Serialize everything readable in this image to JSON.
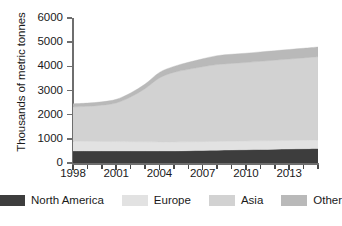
{
  "chart_data": {
    "type": "area",
    "stacked": true,
    "title": "",
    "xlabel": "",
    "ylabel": "Thousands of metric tonnes",
    "ylim": [
      0,
      6000
    ],
    "xlim": [
      1998,
      2015
    ],
    "ytick_labels": [
      "0",
      "1000",
      "2000",
      "3000",
      "4000",
      "5000",
      "6000"
    ],
    "ytick_values": [
      0,
      1000,
      2000,
      3000,
      4000,
      5000,
      6000
    ],
    "xtick_labels": [
      "1998",
      "2001",
      "2004",
      "2007",
      "2010",
      "2013"
    ],
    "xtick_values": [
      1998,
      2001,
      2004,
      2007,
      2010,
      2013
    ],
    "grid": false,
    "legend_position": "bottom",
    "x": [
      1998,
      1999,
      2000,
      2001,
      2002,
      2003,
      2004,
      2005,
      2006,
      2007,
      2008,
      2009,
      2010,
      2011,
      2012,
      2013,
      2014,
      2015
    ],
    "series": [
      {
        "name": "North America",
        "color": "#3d3d3d",
        "values": [
          500,
          500,
          500,
          500,
          500,
          500,
          500,
          500,
          510,
          520,
          530,
          540,
          550,
          560,
          570,
          580,
          590,
          600
        ]
      },
      {
        "name": "Europe",
        "color": "#e2e2e2",
        "values": [
          400,
          395,
          390,
          385,
          380,
          375,
          370,
          368,
          366,
          364,
          362,
          360,
          358,
          356,
          354,
          352,
          350,
          350
        ]
      },
      {
        "name": "Asia",
        "color": "#d2d2d2",
        "values": [
          1420,
          1450,
          1500,
          1600,
          1850,
          2200,
          2650,
          2880,
          3000,
          3100,
          3180,
          3220,
          3250,
          3290,
          3330,
          3370,
          3410,
          3450
        ]
      },
      {
        "name": "Other",
        "color": "#b9b9b9",
        "values": [
          130,
          135,
          140,
          150,
          170,
          190,
          230,
          250,
          290,
          330,
          370,
          380,
          385,
          390,
          392,
          395,
          398,
          400
        ]
      }
    ],
    "totals": [
      2450,
      2480,
      2530,
      2635,
      2900,
      3265,
      3750,
      3998,
      4166,
      4314,
      4442,
      4500,
      4543,
      4596,
      4646,
      4697,
      4748,
      4800
    ]
  },
  "legend": {
    "items": [
      {
        "label": "North America",
        "color": "#3d3d3d"
      },
      {
        "label": "Europe",
        "color": "#e2e2e2"
      },
      {
        "label": "Asia",
        "color": "#d2d2d2"
      },
      {
        "label": "Other",
        "color": "#b9b9b9"
      }
    ]
  }
}
